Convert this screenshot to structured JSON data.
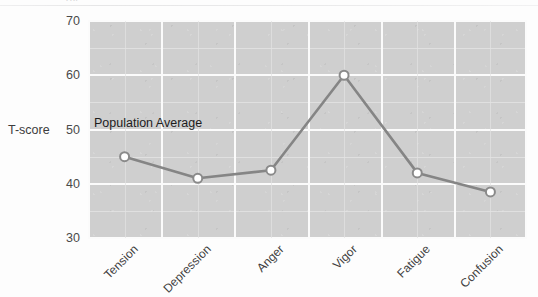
{
  "document": {
    "clipped_title_fragment": "gy",
    "background_color": "#fdfdfd"
  },
  "chart_data": {
    "type": "line",
    "title": "",
    "subtitle": "",
    "xlabel": "",
    "ylabel": "T-score",
    "categories": [
      "Tension",
      "Depression",
      "Anger",
      "Vigor",
      "Fatigue",
      "Confusion"
    ],
    "values": [
      45,
      41,
      42.5,
      60,
      42,
      38.5
    ],
    "series": [
      {
        "name": "Profile",
        "values": [
          45,
          41,
          42.5,
          60,
          42,
          38.5
        ]
      }
    ],
    "ylim": [
      30,
      70
    ],
    "yticks": [
      30,
      40,
      50,
      60,
      70
    ],
    "ytick_labels": [
      "30",
      "40",
      "50",
      "60",
      "70"
    ],
    "y_minor_ticks": [
      35,
      45,
      55,
      65
    ],
    "grid": true,
    "legend": false,
    "legend_position": "none",
    "annotations": [
      {
        "text": "Population Average",
        "x_category": "Tension",
        "y_value": 50,
        "align": "left"
      }
    ],
    "marker": {
      "shape": "circle",
      "fill_color": "#ffffff",
      "edge_color": "#8a8a8a",
      "size": 9
    },
    "line": {
      "color": "#858585",
      "width": 2.6,
      "style": "solid"
    },
    "panel": {
      "background_color": "#cfcfcf",
      "gridline_color": "#fbfbfb",
      "minor_gridline_color": "#e4e4e4"
    }
  },
  "axis": {
    "y_title": "T-score"
  }
}
